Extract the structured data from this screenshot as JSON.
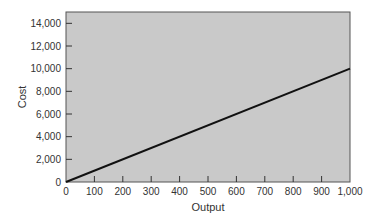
{
  "chart_data": {
    "type": "line",
    "title": "",
    "xlabel": "Output",
    "ylabel": "Cost",
    "xlim": [
      0,
      1000
    ],
    "ylim": [
      0,
      15000
    ],
    "x_ticks": [
      0,
      100,
      200,
      300,
      400,
      500,
      600,
      700,
      800,
      900,
      1000
    ],
    "x_tick_labels": [
      "0",
      "100",
      "200",
      "300",
      "400",
      "500",
      "600",
      "700",
      "800",
      "900",
      "1,000"
    ],
    "y_ticks": [
      0,
      2000,
      4000,
      6000,
      8000,
      10000,
      12000,
      14000
    ],
    "y_tick_labels": [
      "0",
      "2,000",
      "4,000",
      "6,000",
      "8,000",
      "10,000",
      "12,000",
      "14,000"
    ],
    "grid": false,
    "legend": null,
    "series": [
      {
        "name": "Cost",
        "x": [
          0,
          1000
        ],
        "y": [
          0,
          10000
        ],
        "color": "#111111"
      }
    ],
    "plot_background": "#c9c9c9"
  }
}
